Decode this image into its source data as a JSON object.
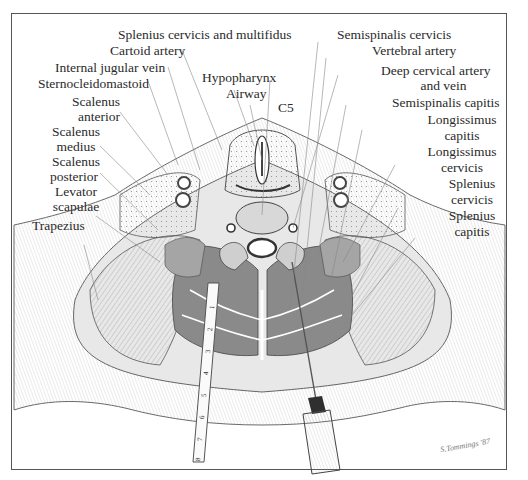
{
  "figure": {
    "labels_left": {
      "splenius_cervicis_multifidus": "Splenius cervicis and multifidus",
      "cartoid_artery": "Cartoid artery",
      "internal_jugular_vein": "Internal jugular vein",
      "sternocleidomastoid": "Sternocleidomastoid",
      "scalenus_anterior_1": "Scalenus",
      "scalenus_anterior_2": "anterior",
      "scalenus_medius_1": "Scalenus",
      "scalenus_medius_2": "medius",
      "scalenus_posterior_1": "Scalenus",
      "scalenus_posterior_2": "posterior",
      "levator_scapulae_1": "Levator",
      "levator_scapulae_2": "scapulae",
      "trapezius": "Trapezius"
    },
    "labels_center": {
      "hypopharynx": "Hypopharynx",
      "airway": "Airway",
      "c5": "C5"
    },
    "labels_right": {
      "semispinalis_cervicis": "Semispinalis cervicis",
      "vertebral_artery": "Vertebral artery",
      "deep_cervical_1": "Deep cervical artery",
      "deep_cervical_2": "and vein",
      "semispinalis_capitis": "Semispinalis capitis",
      "longissimus_capitis_1": "Longissimus",
      "longissimus_capitis_2": "capitis",
      "longissimus_cervicis_1": "Longissimus",
      "longissimus_cervicis_2": "cervicis",
      "splenius_cervicis_1": "Splenius",
      "splenius_cervicis_2": "cervicis",
      "splenius_capitis_1": "Splenius",
      "splenius_capitis_2": "capitis"
    },
    "ruler_marks": [
      "1",
      "2",
      "3",
      "4",
      "5",
      "6",
      "7",
      "8"
    ],
    "signature": "S.Tommings '87",
    "colors": {
      "ink": "#2a2a2a",
      "muscle_dark": "#8a8a8a",
      "muscle_mid": "#b5b5b5",
      "tissue_light": "#dcdcdc",
      "frame": "#555555"
    }
  }
}
